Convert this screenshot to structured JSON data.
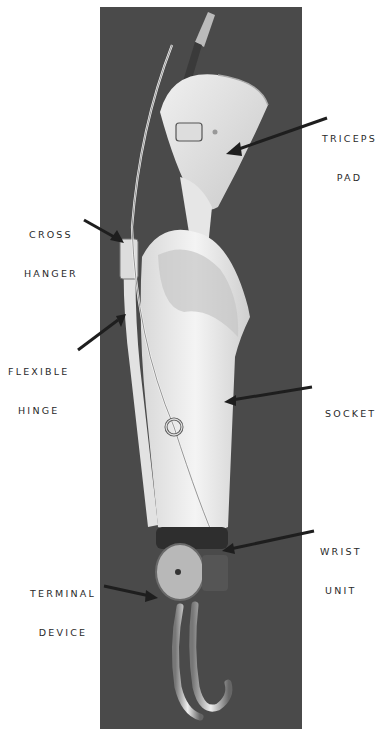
{
  "figure": {
    "labels": [
      {
        "id": "triceps-pad",
        "line1": "TRICEPS",
        "line2": "PAD"
      },
      {
        "id": "cross-hanger",
        "line1": "CROSS",
        "line2": "HANGER"
      },
      {
        "id": "flexible-hinge",
        "line1": "FLEXIBLE",
        "line2": "HINGE"
      },
      {
        "id": "socket",
        "line1": "SOCKET",
        "line2": ""
      },
      {
        "id": "wrist-unit",
        "line1": "WRIST",
        "line2": "UNIT"
      },
      {
        "id": "terminal-device",
        "line1": "TERMINAL",
        "line2": "DEVICE"
      }
    ],
    "colors": {
      "background": "#ffffff",
      "photo_backdrop": "#4a4a4a",
      "prosthesis_light": "#ececec",
      "label_text": "#2a2a2a",
      "arrow": "#1e1e1e"
    }
  }
}
